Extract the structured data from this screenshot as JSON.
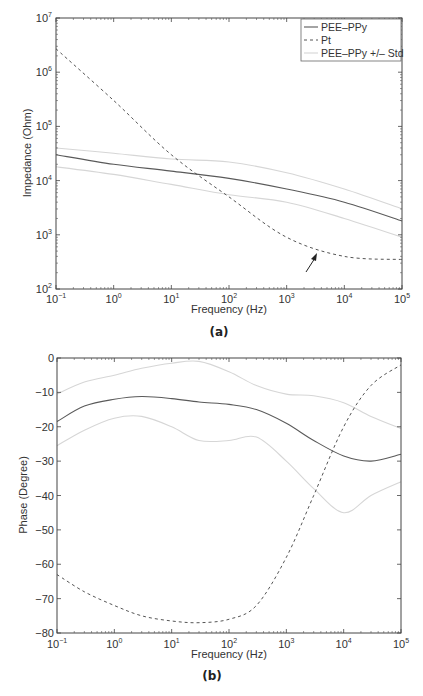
{
  "chart_data": [
    {
      "type": "line",
      "panel_label": "(a)",
      "title": "",
      "xlabel": "Frequency (Hz)",
      "ylabel": "Impedance (Ohm)",
      "xscale": "log",
      "yscale": "log",
      "xlim": [
        0.1,
        100000
      ],
      "ylim": [
        100,
        10000000
      ],
      "x_ticks": [
        "10^-1",
        "10^0",
        "10^1",
        "10^2",
        "10^3",
        "10^4",
        "10^5"
      ],
      "y_ticks": [
        "10^2",
        "10^3",
        "10^4",
        "10^5",
        "10^6",
        "10^7"
      ],
      "grid": false,
      "legend": {
        "position": "upper right",
        "entries": [
          {
            "label": "PEE–PPy",
            "style": "solid",
            "color": "#555555"
          },
          {
            "label": "Pt",
            "style": "dashed",
            "color": "#555555"
          },
          {
            "label": "PEE–PPy +/– Std",
            "style": "solid",
            "color": "#d6d6d6"
          }
        ]
      },
      "annotations": [
        {
          "type": "arrow",
          "points_to_freq_hz": 3000,
          "points_to_value": 600
        }
      ],
      "x": [
        0.1,
        1,
        10,
        100,
        1000,
        10000,
        100000
      ],
      "series": [
        {
          "name": "PEE–PPy",
          "values": [
            30000,
            20000,
            15000,
            11000,
            7000,
            4000,
            1800
          ]
        },
        {
          "name": "Pt",
          "values": [
            2700000,
            300000,
            30000,
            5000,
            900,
            400,
            350
          ]
        },
        {
          "name": "PEE–PPy + Std",
          "values": [
            40000,
            32000,
            25000,
            22000,
            14000,
            7000,
            3000
          ]
        },
        {
          "name": "PEE–PPy – Std",
          "values": [
            18000,
            13000,
            8500,
            5500,
            4000,
            2000,
            900
          ]
        }
      ]
    },
    {
      "type": "line",
      "panel_label": "(b)",
      "title": "",
      "xlabel": "Frequency (Hz)",
      "ylabel": "Phase (Degree)",
      "xscale": "log",
      "yscale": "linear",
      "xlim": [
        0.1,
        100000
      ],
      "ylim": [
        -80,
        0
      ],
      "x_ticks": [
        "10^-1",
        "10^0",
        "10^1",
        "10^2",
        "10^3",
        "10^4",
        "10^5"
      ],
      "y_ticks": [
        "0",
        "-10",
        "-20",
        "-30",
        "-40",
        "-50",
        "-60",
        "-70",
        "-80"
      ],
      "grid": false,
      "x": [
        0.1,
        0.3,
        1,
        3,
        10,
        30,
        100,
        300,
        1000,
        3000,
        10000,
        30000,
        100000
      ],
      "series": [
        {
          "name": "PEE–PPy",
          "values": [
            -18.5,
            -14,
            -12,
            -11.2,
            -11.8,
            -12.8,
            -13.5,
            -15,
            -19,
            -24,
            -28.5,
            -30,
            -28
          ]
        },
        {
          "name": "Pt",
          "values": [
            -63,
            -68,
            -72,
            -75,
            -76.5,
            -77,
            -76,
            -72,
            -58,
            -40,
            -20,
            -8,
            -2
          ]
        },
        {
          "name": "PEE–PPy + Std",
          "values": [
            -10.5,
            -7,
            -5,
            -3,
            -1.5,
            -1,
            -4,
            -8,
            -10.5,
            -11,
            -13,
            -17,
            -20.5
          ]
        },
        {
          "name": "PEE–PPy – Std",
          "values": [
            -25.5,
            -21,
            -17.5,
            -17,
            -20,
            -24,
            -24,
            -23,
            -30,
            -38,
            -45,
            -40,
            -36
          ]
        }
      ]
    }
  ]
}
